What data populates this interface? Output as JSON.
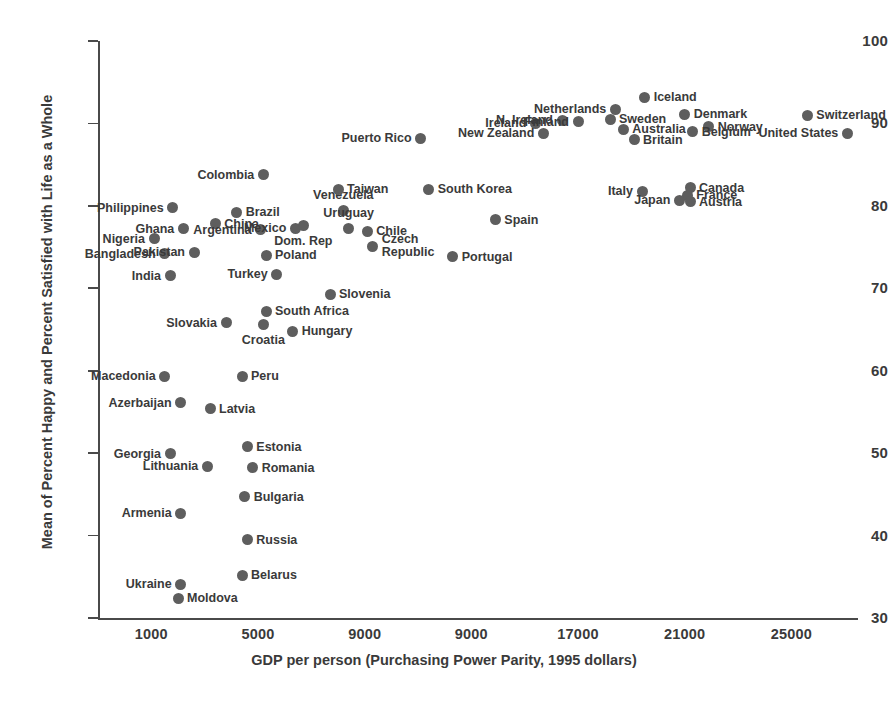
{
  "chart_data": {
    "type": "scatter",
    "title": "",
    "xlabel": "GDP per person (Purchasing Power Parity, 1995 dollars)",
    "ylabel": "Mean of Percent Happy and Percent Satisfied with Life as a Whole",
    "grid": false,
    "legend": "none",
    "xlim": [
      -1000,
      27500
    ],
    "ylim": [
      30,
      100
    ],
    "x_tick_labels": [
      "1000",
      "5000",
      "9000",
      "9000",
      "17000",
      "21000",
      "25000"
    ],
    "x_tick_values": [
      1000,
      5000,
      9000,
      13000,
      17000,
      21000,
      25000
    ],
    "y_tick_labels": [
      "100",
      "90",
      "80",
      "70",
      "60",
      "50",
      "40",
      "30"
    ],
    "y_tick_values": [
      100,
      90,
      80,
      70,
      60,
      50,
      40,
      30
    ],
    "marker_color": "#5e5e5e",
    "axis_color": "#4a4a4a",
    "points": [
      {
        "name": "Philippines",
        "x": 1800,
        "y": 79.8,
        "label_pos": "left"
      },
      {
        "name": "Brazil",
        "x": 4200,
        "y": 79.2,
        "label_pos": "right"
      },
      {
        "name": "China",
        "x": 3400,
        "y": 77.8,
        "label_pos": "right"
      },
      {
        "name": "Ghana",
        "x": 2200,
        "y": 77.2,
        "label_pos": "left"
      },
      {
        "name": "Nigeria",
        "x": 1100,
        "y": 76.0,
        "label_pos": "left"
      },
      {
        "name": "Bangladesh",
        "x": 1500,
        "y": 74.2,
        "label_pos": "left"
      },
      {
        "name": "India",
        "x": 1700,
        "y": 71.5,
        "label_pos": "left"
      },
      {
        "name": "Pakistan",
        "x": 2600,
        "y": 74.4,
        "label_pos": "left"
      },
      {
        "name": "Colombia",
        "x": 5200,
        "y": 83.8,
        "label_pos": "left"
      },
      {
        "name": "Argentina",
        "x": 5100,
        "y": 77.1,
        "label_pos": "left"
      },
      {
        "name": "Mexico",
        "x": 6400,
        "y": 77.3,
        "label_pos": "left"
      },
      {
        "name": "Dom. Rep",
        "x": 6700,
        "y": 77.6,
        "label_pos": "below"
      },
      {
        "name": "Poland",
        "x": 5300,
        "y": 74.0,
        "label_pos": "right"
      },
      {
        "name": "Turkey",
        "x": 5700,
        "y": 71.7,
        "label_pos": "left"
      },
      {
        "name": "Venezuela",
        "x": 8200,
        "y": 79.4,
        "label_pos": "above"
      },
      {
        "name": "Uruguay",
        "x": 8400,
        "y": 77.2,
        "label_pos": "above"
      },
      {
        "name": "Chile",
        "x": 9100,
        "y": 76.9,
        "label_pos": "right"
      },
      {
        "name": "Czech Republic",
        "x": 9300,
        "y": 75.1,
        "label_pos": "right"
      },
      {
        "name": "Taiwan",
        "x": 8000,
        "y": 82.0,
        "label_pos": "right"
      },
      {
        "name": "South Korea",
        "x": 11400,
        "y": 82.0,
        "label_pos": "right"
      },
      {
        "name": "Puerto Rico",
        "x": 11100,
        "y": 88.2,
        "label_pos": "left"
      },
      {
        "name": "Portugal",
        "x": 12300,
        "y": 73.8,
        "label_pos": "right"
      },
      {
        "name": "Spain",
        "x": 13900,
        "y": 78.3,
        "label_pos": "right"
      },
      {
        "name": "Slovenia",
        "x": 7700,
        "y": 69.3,
        "label_pos": "right"
      },
      {
        "name": "South Africa",
        "x": 5300,
        "y": 67.2,
        "label_pos": "right"
      },
      {
        "name": "Croatia",
        "x": 5200,
        "y": 65.6,
        "label_pos": "below"
      },
      {
        "name": "Hungary",
        "x": 6300,
        "y": 64.8,
        "label_pos": "right"
      },
      {
        "name": "Slovakia",
        "x": 3800,
        "y": 65.8,
        "label_pos": "left"
      },
      {
        "name": "Macedonia",
        "x": 1500,
        "y": 59.3,
        "label_pos": "left"
      },
      {
        "name": "Peru",
        "x": 4400,
        "y": 59.3,
        "label_pos": "right"
      },
      {
        "name": "Azerbaijan",
        "x": 2100,
        "y": 56.1,
        "label_pos": "left"
      },
      {
        "name": "Latvia",
        "x": 3200,
        "y": 55.4,
        "label_pos": "right"
      },
      {
        "name": "Georgia",
        "x": 1700,
        "y": 49.9,
        "label_pos": "left"
      },
      {
        "name": "Estonia",
        "x": 4600,
        "y": 50.8,
        "label_pos": "right"
      },
      {
        "name": "Lithuania",
        "x": 3100,
        "y": 48.4,
        "label_pos": "left"
      },
      {
        "name": "Romania",
        "x": 4800,
        "y": 48.2,
        "label_pos": "right"
      },
      {
        "name": "Bulgaria",
        "x": 4500,
        "y": 44.7,
        "label_pos": "right"
      },
      {
        "name": "Armenia",
        "x": 2100,
        "y": 42.7,
        "label_pos": "left"
      },
      {
        "name": "Russia",
        "x": 4600,
        "y": 39.5,
        "label_pos": "right"
      },
      {
        "name": "Belarus",
        "x": 4400,
        "y": 35.2,
        "label_pos": "right"
      },
      {
        "name": "Ukraine",
        "x": 2100,
        "y": 34.1,
        "label_pos": "left"
      },
      {
        "name": "Moldova",
        "x": 2000,
        "y": 32.4,
        "label_pos": "right"
      },
      {
        "name": "Ireland",
        "x": 15400,
        "y": 90.0,
        "label_pos": "left"
      },
      {
        "name": "New Zealand",
        "x": 15700,
        "y": 88.8,
        "label_pos": "left"
      },
      {
        "name": "N. Ireland",
        "x": 16400,
        "y": 90.4,
        "label_pos": "left"
      },
      {
        "name": "Finland",
        "x": 17000,
        "y": 90.2,
        "label_pos": "left"
      },
      {
        "name": "Netherlands",
        "x": 18400,
        "y": 91.7,
        "label_pos": "left"
      },
      {
        "name": "Iceland",
        "x": 19500,
        "y": 93.2,
        "label_pos": "right"
      },
      {
        "name": "Sweden",
        "x": 18200,
        "y": 90.5,
        "label_pos": "right"
      },
      {
        "name": "Australia",
        "x": 18700,
        "y": 89.3,
        "label_pos": "right"
      },
      {
        "name": "Britain",
        "x": 19100,
        "y": 88.0,
        "label_pos": "right"
      },
      {
        "name": "Denmark",
        "x": 21000,
        "y": 91.1,
        "label_pos": "right"
      },
      {
        "name": "Norway",
        "x": 21900,
        "y": 89.6,
        "label_pos": "right"
      },
      {
        "name": "Belgium",
        "x": 21300,
        "y": 89.0,
        "label_pos": "right"
      },
      {
        "name": "Switzerland",
        "x": 25600,
        "y": 91.0,
        "label_pos": "right"
      },
      {
        "name": "United States",
        "x": 27100,
        "y": 88.8,
        "label_pos": "left"
      },
      {
        "name": "Italy",
        "x": 19400,
        "y": 81.8,
        "label_pos": "left"
      },
      {
        "name": "Canada",
        "x": 21200,
        "y": 82.2,
        "label_pos": "right"
      },
      {
        "name": "France",
        "x": 21100,
        "y": 81.3,
        "label_pos": "right"
      },
      {
        "name": "Austria",
        "x": 21200,
        "y": 80.5,
        "label_pos": "right"
      },
      {
        "name": "Japan",
        "x": 20800,
        "y": 80.7,
        "label_pos": "left"
      }
    ]
  }
}
